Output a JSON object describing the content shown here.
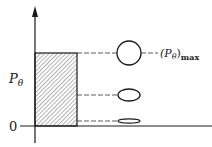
{
  "diagram": {
    "y_axis_label": "P",
    "y_axis_label_sub": "θ",
    "zero_label": "0",
    "max_label_open": "(P",
    "max_label_sub": "θ",
    "max_label_close": ")",
    "max_label_subscript": "max",
    "colors": {
      "ink": "#1a1a1a",
      "hatch": "#555555",
      "background": "#ffffff"
    },
    "levels": [
      {
        "name": "max",
        "y": 53,
        "shape": "circle"
      },
      {
        "name": "mid",
        "y": 95,
        "shape": "ellipse"
      },
      {
        "name": "low",
        "y": 121,
        "shape": "flat-ellipse"
      }
    ]
  }
}
